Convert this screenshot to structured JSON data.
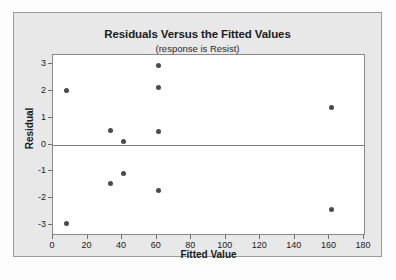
{
  "chart_data": {
    "type": "scatter",
    "title": "Residuals Versus the Fitted Values",
    "subtitle": "(response is Resist)",
    "xlabel": "Fitted Value",
    "ylabel": "Residual",
    "xlim": [
      0,
      180
    ],
    "ylim": [
      -3.35,
      3.35
    ],
    "xticks": [
      0,
      20,
      40,
      60,
      80,
      100,
      120,
      140,
      160,
      180
    ],
    "yticks": [
      3,
      2,
      1,
      0,
      -1,
      -2,
      -3
    ],
    "grid": false,
    "legend": null,
    "reference_line": {
      "axis": "y",
      "value": 0,
      "color": "#7b7b7b"
    },
    "point_color": "#4a4a4a",
    "points": [
      {
        "x": 8,
        "y": 2.03
      },
      {
        "x": 8,
        "y": -2.97
      },
      {
        "x": 33,
        "y": 0.52
      },
      {
        "x": 33,
        "y": -1.47
      },
      {
        "x": 41,
        "y": 0.1
      },
      {
        "x": 41,
        "y": -1.08
      },
      {
        "x": 61,
        "y": 2.96
      },
      {
        "x": 61,
        "y": 2.15
      },
      {
        "x": 61,
        "y": 0.47
      },
      {
        "x": 61,
        "y": -1.72
      },
      {
        "x": 161,
        "y": 1.4
      },
      {
        "x": 161,
        "y": -2.42
      }
    ]
  }
}
